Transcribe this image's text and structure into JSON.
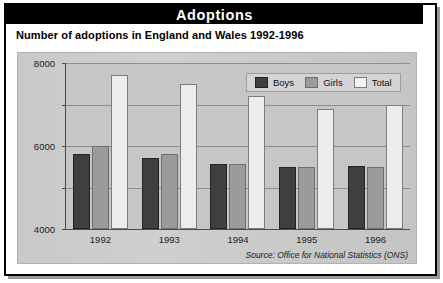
{
  "header": {
    "title": "Adoptions",
    "subtitle": "Number of adoptions in England and Wales 1992-1996"
  },
  "source_note": "Source: Office for National Statistics (ONS)",
  "colors": {
    "title_bar_bg": "#000000",
    "title_bar_text": "#ffffff",
    "panel_bg": "#c6c6c6",
    "boys": "#3f3f3f",
    "girls": "#9b9b9b",
    "total": "#ececec",
    "gridline": "#8e8e8e",
    "axis": "#4a4a4a"
  },
  "chart_data": {
    "type": "bar",
    "title": "Number of adoptions in England and Wales 1992-1996",
    "xlabel": "",
    "ylabel": "",
    "categories": [
      "1992",
      "1993",
      "1994",
      "1995",
      "1996"
    ],
    "series": [
      {
        "name": "Boys",
        "color": "#3f3f3f",
        "values": [
          3600,
          3400,
          3150,
          3000,
          3050
        ]
      },
      {
        "name": "Girls",
        "color": "#9b9b9b",
        "values": [
          4000,
          3600,
          3150,
          3000,
          3000
        ]
      },
      {
        "name": "Total",
        "color": "#ececec",
        "values": [
          7400,
          7000,
          6400,
          5800,
          6000
        ]
      }
    ],
    "ylim": [
      0,
      8000
    ],
    "yticks": [
      0,
      2000,
      4000,
      6000,
      8000
    ],
    "ytick_labels": [
      "0",
      "2000",
      "4000",
      "6000",
      "8000"
    ],
    "grid": true,
    "legend_position": "top-right",
    "legend_entries": [
      "Boys",
      "Girls",
      "Total"
    ]
  }
}
